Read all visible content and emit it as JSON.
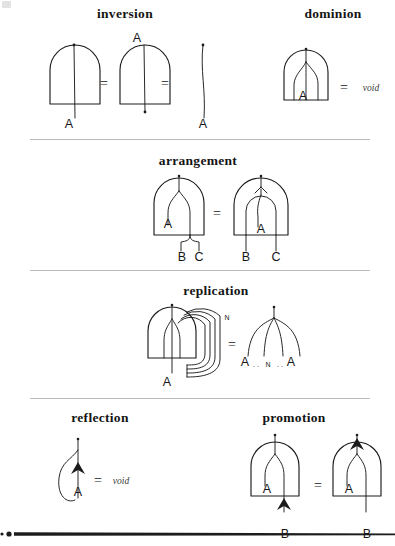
{
  "page": {
    "background": "#ffffff",
    "ink": "#1c1c1c",
    "rule_color": "#b9b9b9"
  },
  "sections": [
    {
      "id": "inversion",
      "title": "inversion",
      "equals": [
        "=",
        "="
      ],
      "labels": [
        "A",
        "A",
        "A"
      ],
      "description": "A dome with a strand through it equals a dome with strand ending above, equals a bare strand."
    },
    {
      "id": "dominion",
      "title": "dominion",
      "equals": [
        "="
      ],
      "labels": [
        "A"
      ],
      "void_text": "void",
      "description": "A dome containing a branching strand labeled A equals void."
    },
    {
      "id": "arrangement",
      "title": "arrangement",
      "equals": [
        "="
      ],
      "labels_left": [
        "A",
        "B",
        "C"
      ],
      "labels_right": [
        "A",
        "B",
        "C"
      ],
      "description": "A dome with A branching into B and C equals nested domes with A over B and C."
    },
    {
      "id": "replication",
      "title": "replication",
      "equals": [
        "="
      ],
      "labels_left": [
        "A",
        "N"
      ],
      "labels_right": [
        "A",
        "N",
        "A"
      ],
      "right_expression": "A . . N . . A",
      "description": "A dome with N looped copies equals a fan of N strands from A to A."
    },
    {
      "id": "reflection",
      "title": "reflection",
      "equals": [
        "="
      ],
      "labels": [
        "A"
      ],
      "void_text": "void",
      "description": "A loop with an upward arrow on strand A equals void."
    },
    {
      "id": "promotion",
      "title": "promotion",
      "equals": [
        "="
      ],
      "labels_left": [
        "A",
        "B"
      ],
      "labels_right": [
        "A",
        "B"
      ],
      "description": "A dome with A and an arrow entering at B equals a dome with the arrow moved to the top output."
    }
  ]
}
